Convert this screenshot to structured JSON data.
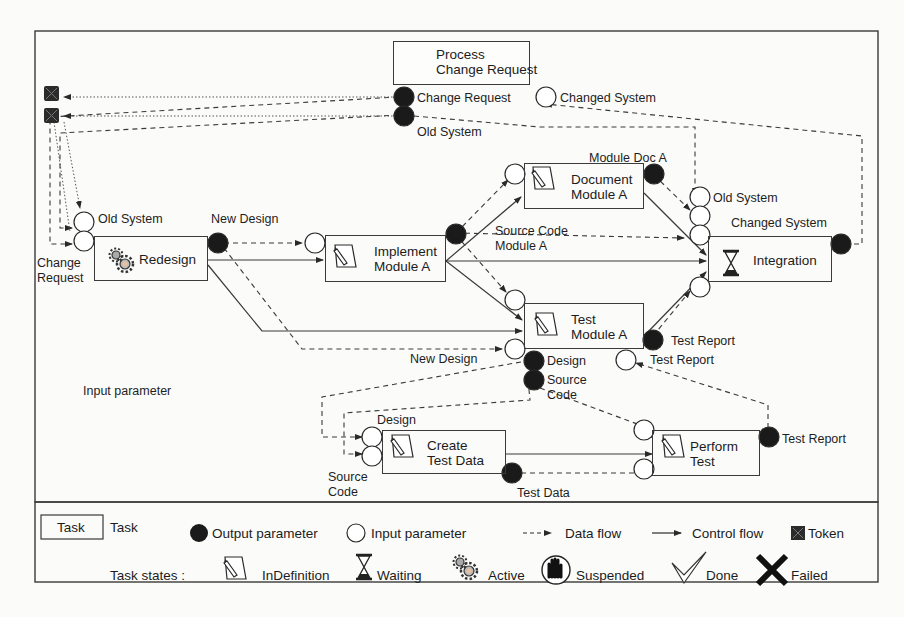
{
  "diagram": {
    "tasks": [
      {
        "id": "process_change_request",
        "name_line1": "Process",
        "name_line2": "Change Request",
        "state": "Active"
      },
      {
        "id": "redesign",
        "name_line1": "Redesign",
        "name_line2": "",
        "state": "Active"
      },
      {
        "id": "implement_module_a",
        "name_line1": "Implement",
        "name_line2": "Module A",
        "state": "InDefinition"
      },
      {
        "id": "document_module_a",
        "name_line1": "Document",
        "name_line2": "Module A",
        "state": "InDefinition"
      },
      {
        "id": "test_module_a",
        "name_line1": "Test",
        "name_line2": "Module A",
        "state": "InDefinition"
      },
      {
        "id": "integration",
        "name_line1": "Integration",
        "name_line2": "",
        "state": "Waiting"
      },
      {
        "id": "create_test_data",
        "name_line1": "Create",
        "name_line2": "Test Data",
        "state": "InDefinition"
      },
      {
        "id": "perform_test",
        "name_line1": "Perform",
        "name_line2": "Test",
        "state": "InDefinition"
      }
    ],
    "parameter_labels": {
      "pcr_out_change_request": "Change Request",
      "pcr_in_changed_system": "Changed System",
      "pcr_out_old_system": "Old System",
      "redesign_in_old_system": "Old System",
      "redesign_in_change_request_1": "Change",
      "redesign_in_change_request_2": "Request",
      "redesign_out_new_design": "New Design",
      "impl_out_source_code_1": "Source Code",
      "impl_out_source_code_2": "Module A",
      "doc_out_module_doc": "Module Doc A",
      "integ_in_old_system": "Old System",
      "integ_out_changed_system": "Changed System",
      "test_in_new_design": "New Design",
      "test_out_design": "Design",
      "test_out_source_code_1": "Source",
      "test_out_source_code_2": "Code",
      "test_out_test_report": "Test Report",
      "test_in_test_report": "Test Report",
      "ctd_in_design": "Design",
      "ctd_in_source_code_1": "Source",
      "ctd_in_source_code_2": "Code",
      "ctd_out_test_data": "Test Data",
      "pt_out_test_report": "Test Report"
    },
    "floating_label": "Input parameter",
    "tokens": 2
  },
  "legend": {
    "task_box": "Task",
    "task": "Task",
    "output_parameter": "Output parameter",
    "input_parameter": "Input parameter",
    "data_flow": "Data flow",
    "control_flow": "Control flow",
    "token": "Token",
    "task_states_label": "Task states :",
    "states": [
      {
        "icon": "pencil-document-icon",
        "label": "InDefinition"
      },
      {
        "icon": "hourglass-icon",
        "label": "Waiting"
      },
      {
        "icon": "gears-icon",
        "label": "Active"
      },
      {
        "icon": "hand-stop-icon",
        "label": "Suspended"
      },
      {
        "icon": "checkmark-icon",
        "label": "Done"
      },
      {
        "icon": "x-cross-icon",
        "label": "Failed"
      }
    ]
  },
  "colors": {
    "line": "#3a3a3a",
    "output_param": "#1a1a1a",
    "input_param": "#ffffff",
    "background": "#fbfbf9"
  }
}
